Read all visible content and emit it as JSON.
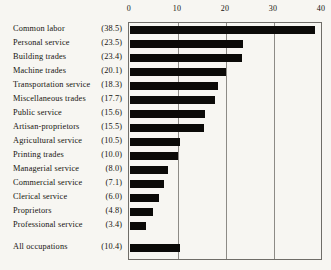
{
  "chart_data": {
    "type": "bar",
    "orientation": "horizontal",
    "title": "",
    "xlabel": "",
    "ylabel": "",
    "xlim": [
      0,
      40
    ],
    "xticks": [
      0,
      10,
      20,
      30,
      40
    ],
    "xtick_labels": [
      "0",
      "10",
      "20",
      "30",
      "40"
    ],
    "grid": true,
    "legend": null,
    "bar_color": "#0b0a08",
    "background_color": "#f7f6f2",
    "axis_color": "#6f6d68",
    "gridline_color": "#8d8b86",
    "categories": [
      "Common labor",
      "Personal service",
      "Building trades",
      "Machine trades",
      "Transportation service",
      "Miscellaneous trades",
      "Public service",
      "Artisan-proprietors",
      "Agricultural service",
      "Printing trades",
      "Managerial service",
      "Commercial service",
      "Clerical service",
      "Proprietors",
      "Professional service",
      "All occupations"
    ],
    "values": [
      38.5,
      23.5,
      23.4,
      20.1,
      18.3,
      17.7,
      15.6,
      15.5,
      10.5,
      10.0,
      8.0,
      7.1,
      6.0,
      4.8,
      3.4,
      10.4
    ],
    "value_labels": [
      "(38.5)",
      "(23.5)",
      "(23.4)",
      "(20.1)",
      "(18.3)",
      "(17.7)",
      "(15.6)",
      "(15.5)",
      "(10.5)",
      "(10.0)",
      "(8.0)",
      "(7.1)",
      "(6.0)",
      "(4.8)",
      "(3.4)",
      "(10.4)"
    ],
    "summary_row_index": 15
  }
}
